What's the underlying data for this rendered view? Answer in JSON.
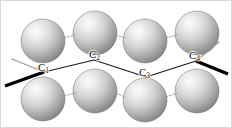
{
  "figure": {
    "width": 232,
    "height": 128,
    "background_color": "#ffffff",
    "frame_color": "#d8d8d8"
  },
  "colors": {
    "sphere_light": "#f2f2f2",
    "sphere_mid": "#c8c8c8",
    "sphere_dark": "#8f8f8f",
    "sphere_edge": "#6e6e6e",
    "chain_bond": "#1a1a1a",
    "bold_bond": "#000000",
    "thin_bond": "#9a9a9a",
    "sphere_link": "#9a9a9a",
    "label_color": "#101010"
  },
  "labels": [
    {
      "id": "c1",
      "element": "C",
      "subscript": "1",
      "x": 38,
      "y": 68
    },
    {
      "id": "c2",
      "element": "C",
      "subscript": "2",
      "x": 89,
      "y": 55
    },
    {
      "id": "c3",
      "element": "C",
      "subscript": "3",
      "x": 139,
      "y": 73
    },
    {
      "id": "c4",
      "element": "C",
      "subscript": "4",
      "x": 189,
      "y": 56
    }
  ],
  "chain": {
    "name": "carbon-backbone",
    "vertices": [
      {
        "id": "c1",
        "x": 44,
        "y": 72
      },
      {
        "id": "c2",
        "x": 94,
        "y": 60
      },
      {
        "id": "c3",
        "x": 146,
        "y": 77
      },
      {
        "id": "c4",
        "x": 196,
        "y": 61
      }
    ],
    "terminal_bonds": [
      {
        "id": "c1-thin-up-left",
        "style": "thin",
        "x1": 44,
        "y1": 72,
        "x2": 12,
        "y2": 59
      },
      {
        "id": "c1-bold-down-left",
        "style": "bold",
        "x1": 44,
        "y1": 72,
        "x2": 5,
        "y2": 86
      },
      {
        "id": "c4-thin-up-right",
        "style": "thin",
        "x1": 196,
        "y1": 61,
        "x2": 219,
        "y2": 42
      },
      {
        "id": "c4-bold-down-right",
        "style": "bold",
        "x1": 196,
        "y1": 61,
        "x2": 228,
        "y2": 74
      }
    ]
  },
  "spheres": {
    "radius": 22,
    "top_row": [
      {
        "id": "top-1",
        "cx": 43,
        "cy": 41
      },
      {
        "id": "top-2",
        "cx": 95,
        "cy": 33
      },
      {
        "id": "top-3",
        "cx": 145,
        "cy": 41
      },
      {
        "id": "top-4",
        "cx": 197,
        "cy": 33
      }
    ],
    "bottom_row": [
      {
        "id": "bottom-1",
        "cx": 43,
        "cy": 99
      },
      {
        "id": "bottom-2",
        "cx": 95,
        "cy": 91
      },
      {
        "id": "bottom-3",
        "cx": 145,
        "cy": 100
      },
      {
        "id": "bottom-4",
        "cx": 197,
        "cy": 91
      }
    ],
    "links": [
      {
        "id": "top-link-1-2",
        "x1": 64,
        "y1": 38,
        "x2": 75,
        "y2": 35
      },
      {
        "id": "top-link-2-3",
        "x1": 116,
        "y1": 35,
        "x2": 125,
        "y2": 38
      },
      {
        "id": "top-link-3-4",
        "x1": 166,
        "y1": 38,
        "x2": 177,
        "y2": 35
      },
      {
        "id": "bottom-link-1-2",
        "x1": 64,
        "y1": 96,
        "x2": 75,
        "y2": 93
      },
      {
        "id": "bottom-link-2-3",
        "x1": 116,
        "y1": 93,
        "x2": 125,
        "y2": 97
      },
      {
        "id": "bottom-link-3-4",
        "x1": 166,
        "y1": 97,
        "x2": 177,
        "y2": 93
      }
    ]
  }
}
